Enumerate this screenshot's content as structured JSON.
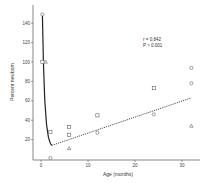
{
  "chart_data": {
    "type": "scatter",
    "title": "",
    "xlabel": "Age (months)",
    "ylabel": "Percent newborn",
    "xlim": [
      -1,
      34
    ],
    "ylim": [
      -4,
      155
    ],
    "x_ticks": [
      "0",
      "10",
      "20",
      "30"
    ],
    "y_ticks": [
      "20",
      "40",
      "60",
      "80",
      "100",
      "120",
      "140"
    ],
    "grid": false,
    "legend": null,
    "annotations": [
      "r = 0.842",
      "P > 0.001"
    ],
    "series": [
      {
        "name": "circles",
        "marker": "circle",
        "points": [
          [
            0.3,
            149
          ],
          [
            2,
            1
          ],
          [
            12,
            27
          ],
          [
            24,
            46
          ],
          [
            32,
            94
          ],
          [
            32,
            78
          ]
        ]
      },
      {
        "name": "squares",
        "marker": "square",
        "points": [
          [
            0.3,
            100
          ],
          [
            2,
            28
          ],
          [
            6,
            33
          ],
          [
            6,
            25
          ],
          [
            12,
            45
          ],
          [
            24,
            73
          ]
        ]
      },
      {
        "name": "triangles",
        "marker": "triangle",
        "points": [
          [
            1,
            100
          ],
          [
            6,
            11
          ],
          [
            32,
            34
          ]
        ]
      }
    ],
    "curves": [
      {
        "name": "decay fit",
        "style": "solid",
        "points": [
          [
            0.3,
            149
          ],
          [
            0.5,
            100
          ],
          [
            0.8,
            60
          ],
          [
            1.2,
            35
          ],
          [
            1.6,
            22
          ],
          [
            2,
            16
          ],
          [
            2.3,
            14
          ]
        ]
      },
      {
        "name": "linear regression",
        "style": "dashed",
        "points": [
          [
            2.3,
            14
          ],
          [
            32,
            63
          ]
        ]
      }
    ]
  }
}
